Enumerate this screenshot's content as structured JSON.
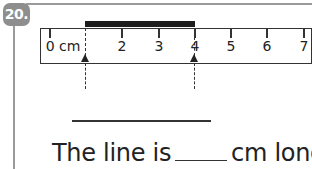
{
  "question": {
    "number_label": "20.",
    "badge_color": "#8e8e8e"
  },
  "ruler": {
    "unit_label": "0 cm",
    "ticks": [
      "0 cm",
      "1",
      "2",
      "3",
      "4",
      "5",
      "6",
      "7"
    ],
    "visible_tick_labels": [
      "0 cm",
      "",
      "2",
      "3",
      "4",
      "5",
      "6",
      "7"
    ],
    "measured_line": {
      "start_cm": 1,
      "end_cm": 4,
      "color": "#1e1e1e"
    },
    "arrows": [
      {
        "at_cm": 1,
        "icon": "arrow-up-icon"
      },
      {
        "at_cm": 4,
        "icon": "arrow-up-icon"
      }
    ]
  },
  "answer": {
    "draw_line_blank": "",
    "sentence_prefix": "The line is",
    "blank_value": "",
    "sentence_suffix": "cm long."
  }
}
